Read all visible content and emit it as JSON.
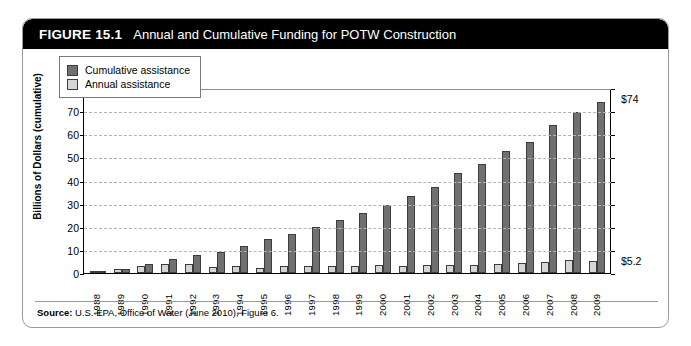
{
  "figure": {
    "number": "FIGURE 15.1",
    "title": "Annual and Cumulative Funding for POTW Construction",
    "source_label": "Source:",
    "source_text": "U.S. EPA, Office of Water (June 2010), Figure 6."
  },
  "colors": {
    "cumulative": "#707070",
    "annual": "#d6d6d6",
    "header_bg": "#000000",
    "header_text": "#ffffff",
    "grid": "#b4b4b4"
  },
  "annotations": {
    "top": "$74",
    "bottom": "$5.2"
  },
  "chart_data": {
    "type": "bar",
    "title": "Annual and Cumulative Funding for POTW Construction",
    "xlabel": "",
    "ylabel": "Billions of Dollars (cumulative)",
    "ylim": [
      0,
      80
    ],
    "yticks": [
      0,
      10,
      20,
      30,
      40,
      50,
      60,
      70,
      80
    ],
    "grid": true,
    "legend_position": "top-left",
    "categories": [
      "1988",
      "1989",
      "1990",
      "1991",
      "1992",
      "1993",
      "1994",
      "1995",
      "1996",
      "1997",
      "1998",
      "1999",
      "2000",
      "2001",
      "2002",
      "2003",
      "2004",
      "2005",
      "2006",
      "2007",
      "2008",
      "2009"
    ],
    "series": [
      {
        "name": "Annual assistance",
        "color": "#d6d6d6",
        "values": [
          0.8,
          1.6,
          3.2,
          3.9,
          3.8,
          2.7,
          3.2,
          2.0,
          3.2,
          3.2,
          3.0,
          3.2,
          3.4,
          3.2,
          3.5,
          3.5,
          3.6,
          3.7,
          4.2,
          4.8,
          5.6,
          5.2
        ]
      },
      {
        "name": "Cumulative assistance",
        "color": "#707070",
        "values": [
          0.8,
          1.7,
          3.8,
          6.2,
          7.6,
          9.0,
          11.7,
          14.6,
          17.0,
          19.9,
          22.8,
          26.0,
          29.6,
          33.2,
          37.2,
          43.4,
          47.0,
          52.8,
          56.8,
          64.0,
          69.6,
          74.0
        ]
      }
    ]
  }
}
